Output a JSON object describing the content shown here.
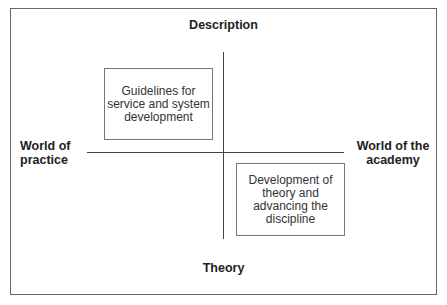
{
  "diagram": {
    "axes": {
      "top_label": "Description",
      "bottom_label": "Theory",
      "left_label": "World of\npractice",
      "right_label": "World of the\nacademy"
    },
    "quadrant_boxes": [
      {
        "quadrant": "upper-left",
        "text": "Guidelines for\nservice and system\ndevelopment"
      },
      {
        "quadrant": "lower-right",
        "text": "Development of\ntheory and\nadvancing the\ndiscipline"
      }
    ]
  }
}
